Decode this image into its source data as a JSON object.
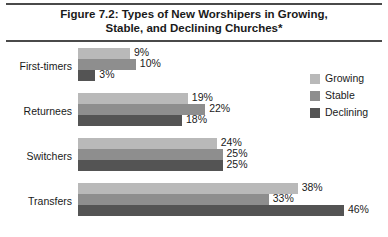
{
  "figure": {
    "title_line1": "Figure 7.2: Types of New Worshipers in Growing,",
    "title_line2": "Stable, and Declining Churches*"
  },
  "legend": {
    "items": [
      {
        "label": "Growing",
        "color": "#b9b9b9",
        "key": "growing"
      },
      {
        "label": "Stable",
        "color": "#8e8e8e",
        "key": "stable"
      },
      {
        "label": "Declining",
        "color": "#545454",
        "key": "declining"
      }
    ]
  },
  "chart_data": {
    "type": "bar",
    "orientation": "horizontal",
    "title": "Figure 7.2: Types of New Worshipers in Growing, Stable, and Declining Churches*",
    "xlabel": "",
    "ylabel": "",
    "xlim": [
      0,
      50
    ],
    "grid": false,
    "legend_position": "right",
    "categories": [
      "First-timers",
      "Returnees",
      "Switchers",
      "Transfers"
    ],
    "series": [
      {
        "name": "Growing",
        "color": "#b9b9b9",
        "values": [
          9,
          19,
          24,
          38
        ],
        "labels": [
          "9%",
          "19%",
          "24%",
          "38%"
        ]
      },
      {
        "name": "Stable",
        "color": "#8e8e8e",
        "values": [
          10,
          22,
          25,
          33
        ],
        "labels": [
          "10%",
          "22%",
          "25%",
          "33%"
        ]
      },
      {
        "name": "Declining",
        "color": "#545454",
        "values": [
          3,
          18,
          25,
          46
        ],
        "labels": [
          "3%",
          "18%",
          "25%",
          "46%"
        ]
      }
    ]
  }
}
